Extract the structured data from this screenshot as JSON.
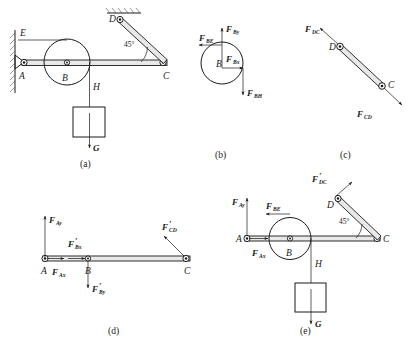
{
  "figure": {
    "background_color": "#ffffff",
    "line_color": "#1a1a1a",
    "captions": [
      {
        "id": "a",
        "text": "(a)"
      },
      {
        "id": "b",
        "text": "(b)"
      },
      {
        "id": "c",
        "text": "(c)"
      },
      {
        "id": "d",
        "text": "(d)"
      },
      {
        "id": "e",
        "text": "(e)"
      }
    ]
  },
  "panel_a": {
    "caption": "(a)",
    "points": {
      "A": "A",
      "B": "B",
      "C": "C",
      "D": "D",
      "E": "E",
      "H": "H"
    },
    "angle": "45°",
    "weight_label": "G",
    "description": "Assembly: horizontal beam AC pinned to wall at A, pulley at B, link DC at 45 degrees to ceiling support D, cable over pulley to E and down to block H of weight G"
  },
  "panel_b": {
    "caption": "(b)",
    "body_label": "B",
    "forces": [
      {
        "name": "F_BE",
        "base": "F",
        "sub": "BE",
        "direction": "left"
      },
      {
        "name": "F_By",
        "base": "F",
        "sub": "By",
        "direction": "up"
      },
      {
        "name": "F_Bx",
        "base": "F",
        "sub": "Bx",
        "direction": "right"
      },
      {
        "name": "F_BH",
        "base": "F",
        "sub": "BH",
        "direction": "down"
      }
    ],
    "description": "Free body of pulley B"
  },
  "panel_c": {
    "caption": "(c)",
    "points": {
      "C": "C",
      "D": "D"
    },
    "forces": [
      {
        "name": "F_DC",
        "base": "F",
        "sub": "DC",
        "direction": "up-left"
      },
      {
        "name": "F_CD",
        "base": "F",
        "sub": "CD",
        "direction": "down-right"
      }
    ],
    "description": "Free body of two-force link CD"
  },
  "panel_d": {
    "caption": "(d)",
    "points": {
      "A": "A",
      "B": "B",
      "C": "C"
    },
    "forces": [
      {
        "name": "F_Ay",
        "base": "F",
        "sub": "Ay",
        "direction": "up",
        "prime": false
      },
      {
        "name": "F_Ax",
        "base": "F",
        "sub": "Ax",
        "direction": "right",
        "prime": false
      },
      {
        "name": "F'_Bx",
        "base": "F",
        "sub": "Bx",
        "direction": "right",
        "prime": true
      },
      {
        "name": "F'_By",
        "base": "F",
        "sub": "By",
        "direction": "down",
        "prime": true
      },
      {
        "name": "F'_CD",
        "base": "F",
        "sub": "CD",
        "direction": "up-left",
        "prime": true
      }
    ],
    "description": "Free body of beam AC"
  },
  "panel_e": {
    "caption": "(e)",
    "points": {
      "A": "A",
      "B": "B",
      "C": "C",
      "D": "D",
      "H": "H"
    },
    "angle": "45°",
    "weight_label": "G",
    "forces": [
      {
        "name": "F_Ay",
        "base": "F",
        "sub": "Ay",
        "direction": "up",
        "prime": false
      },
      {
        "name": "F_BE",
        "base": "F",
        "sub": "BE",
        "direction": "left",
        "prime": false
      },
      {
        "name": "F_Ax",
        "base": "F",
        "sub": "Ax",
        "direction": "right",
        "prime": false
      },
      {
        "name": "F'_DC",
        "base": "F",
        "sub": "DC",
        "direction": "up-right",
        "prime": true
      }
    ],
    "description": "Free body of whole system excluding supports"
  }
}
